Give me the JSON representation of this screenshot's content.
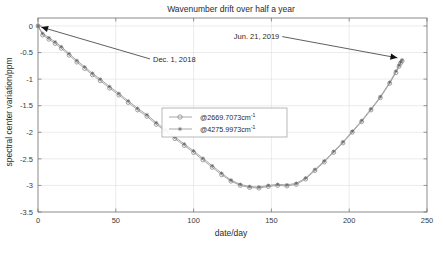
{
  "chart_data": {
    "type": "line",
    "title": "Wavenumber drift over half a year",
    "xlabel": "date/day",
    "ylabel": "spectral center variation/ppm",
    "xlim": [
      0,
      250
    ],
    "ylim": [
      -3.5,
      0.15
    ],
    "xticks": [
      0,
      50,
      100,
      150,
      200,
      250
    ],
    "xticklabels": [
      "0",
      "50",
      "100",
      "150",
      "200",
      "250"
    ],
    "yticks": [
      0,
      -0.5,
      -1,
      -1.5,
      -2,
      -2.5,
      -3,
      -3.5
    ],
    "yticklabels": [
      "0",
      "-0.5",
      "-1",
      "-1.5",
      "-2",
      "-2.5",
      "-3",
      "-3.5"
    ],
    "grid": true,
    "legend_position": "center",
    "series": [
      {
        "name": "@2669.7073cm",
        "name_sup": "-1",
        "marker": "open-circle",
        "color": "#7d7d7d",
        "x": [
          0,
          3,
          7,
          11,
          15,
          20,
          25,
          30,
          35,
          40,
          46,
          52,
          58,
          64,
          70,
          76,
          82,
          88,
          94,
          100,
          106,
          112,
          118,
          124,
          130,
          136,
          142,
          148,
          154,
          160,
          166,
          172,
          178,
          184,
          190,
          196,
          202,
          208,
          214,
          220,
          226,
          230,
          232,
          233,
          234
        ],
        "y": [
          0.0,
          -0.17,
          -0.25,
          -0.33,
          -0.42,
          -0.55,
          -0.68,
          -0.8,
          -0.92,
          -1.03,
          -1.17,
          -1.3,
          -1.44,
          -1.58,
          -1.7,
          -1.85,
          -1.98,
          -2.12,
          -2.25,
          -2.38,
          -2.52,
          -2.66,
          -2.8,
          -2.92,
          -3.0,
          -3.04,
          -3.05,
          -3.02,
          -3.0,
          -3.01,
          -2.98,
          -2.88,
          -2.72,
          -2.56,
          -2.38,
          -2.2,
          -2.0,
          -1.8,
          -1.58,
          -1.35,
          -1.08,
          -0.88,
          -0.76,
          -0.7,
          -0.66
        ]
      },
      {
        "name": "@4275.9973cm",
        "name_sup": "-1",
        "marker": "star",
        "color": "#5c5c5c",
        "x": [
          0,
          3,
          7,
          11,
          15,
          20,
          25,
          30,
          35,
          40,
          46,
          52,
          58,
          64,
          70,
          76,
          82,
          88,
          94,
          100,
          106,
          112,
          118,
          124,
          130,
          136,
          142,
          148,
          154,
          160,
          166,
          172,
          178,
          184,
          190,
          196,
          202,
          208,
          214,
          220,
          226,
          230,
          232,
          233,
          234
        ],
        "y": [
          0.0,
          -0.14,
          -0.22,
          -0.3,
          -0.39,
          -0.52,
          -0.65,
          -0.77,
          -0.89,
          -1.0,
          -1.14,
          -1.27,
          -1.41,
          -1.55,
          -1.67,
          -1.82,
          -1.95,
          -2.09,
          -2.22,
          -2.35,
          -2.49,
          -2.63,
          -2.77,
          -2.9,
          -2.98,
          -3.02,
          -3.03,
          -3.0,
          -2.98,
          -2.99,
          -2.96,
          -2.86,
          -2.7,
          -2.54,
          -2.36,
          -2.18,
          -1.98,
          -1.78,
          -1.56,
          -1.33,
          -1.06,
          -0.85,
          -0.74,
          -0.68,
          -0.64
        ]
      }
    ],
    "annotations": [
      {
        "id": "start-annotation",
        "text": "Dec. 1, 2018",
        "target_x": 2,
        "target_y": -0.02,
        "text_x": 72,
        "text_y": -0.62
      },
      {
        "id": "end-annotation",
        "text": "Jun. 21, 2019",
        "target_x": 231,
        "target_y": -0.6,
        "text_x": 157,
        "text_y": -0.2
      }
    ]
  }
}
